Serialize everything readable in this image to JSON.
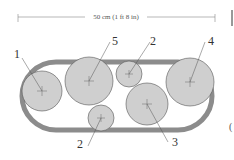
{
  "dimension": {
    "label": "50 cm (1 ft 8 in)"
  },
  "labels": [
    {
      "id": "1",
      "text": "1"
    },
    {
      "id": "5",
      "text": "5"
    },
    {
      "id": "2a",
      "text": "2"
    },
    {
      "id": "4",
      "text": "4"
    },
    {
      "id": "2b",
      "text": "2"
    },
    {
      "id": "3",
      "text": "3"
    }
  ],
  "colors": {
    "container": "#8c8c8c",
    "plant": "#cfcfcf",
    "outline": "#555555"
  }
}
